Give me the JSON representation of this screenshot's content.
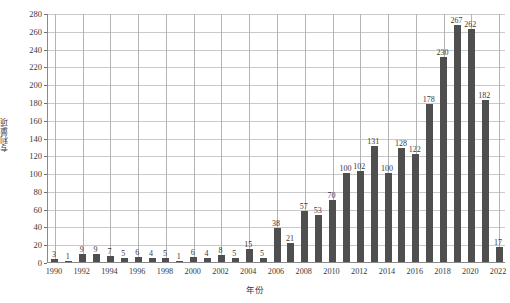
{
  "chart_data": {
    "type": "bar",
    "title": "",
    "subtitle": "",
    "xlabel": "年份",
    "ylabel": "专利量/项",
    "legend": [],
    "legend_position": "none",
    "grid": true,
    "grid_axes": "both",
    "bar_color": "#4f4f4f",
    "axis_color": "#8a8a8a",
    "gridline_color": "#c9c9c9",
    "data_labels": true,
    "ylim": [
      0,
      280
    ],
    "ytick_step": 20,
    "ytick_labels": [
      "0",
      "20",
      "40",
      "60",
      "80",
      "100",
      "120",
      "140",
      "160",
      "180",
      "200",
      "220",
      "240",
      "260",
      "280"
    ],
    "xtick_labels": [
      "1990",
      "1992",
      "1994",
      "1996",
      "1998",
      "2000",
      "2002",
      "2004",
      "2006",
      "2008",
      "2010",
      "2012",
      "2014",
      "2016",
      "2018",
      "2020",
      "2022"
    ],
    "xtick_step": 2,
    "categories": [
      "1990",
      "1991",
      "1992",
      "1993",
      "1994",
      "1995",
      "1996",
      "1997",
      "1998",
      "1999",
      "2000",
      "2001",
      "2002",
      "2003",
      "2004",
      "2005",
      "2006",
      "2007",
      "2008",
      "2009",
      "2010",
      "2011",
      "2012",
      "2013",
      "2014",
      "2015",
      "2016",
      "2017",
      "2018",
      "2019",
      "2020",
      "2021",
      "2022"
    ],
    "values": [
      3,
      1,
      9,
      9,
      7,
      5,
      6,
      4,
      5,
      1,
      6,
      4,
      8,
      5,
      15,
      5,
      38,
      21,
      57,
      53,
      70,
      100,
      102,
      131,
      100,
      128,
      122,
      178,
      230,
      267,
      262,
      182,
      17
    ],
    "value_labels": [
      "3",
      "1",
      "9",
      "9",
      "7",
      "5",
      "6",
      "4",
      "5",
      "1",
      "6",
      "4",
      "8",
      "5",
      "15",
      "5",
      "38",
      "21",
      "57",
      "53",
      "70",
      "100",
      "102",
      "131",
      "100",
      "128",
      "122",
      "178",
      "230",
      "267",
      "262",
      "182",
      "17"
    ]
  }
}
